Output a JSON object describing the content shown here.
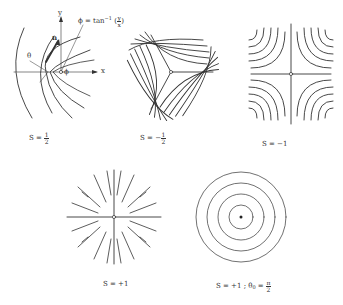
{
  "figure": {
    "panels": [
      {
        "id": "s-half",
        "caption": {
          "prefix": "S = ",
          "sign": "",
          "num": "1",
          "den": "2"
        },
        "annotations": {
          "y_axis": "y",
          "x_axis": "x",
          "phi": "ϕ",
          "theta": "θ",
          "n_vector": "n",
          "phi_formula": {
            "lhs": "ϕ = tan",
            "sup": "−1",
            "open": "(",
            "num": "y",
            "den": "x",
            "close": ")"
          }
        }
      },
      {
        "id": "s-minus-half",
        "caption": {
          "prefix": "S = ",
          "sign": "−",
          "num": "1",
          "den": "2"
        }
      },
      {
        "id": "s-minus-one",
        "caption": {
          "text": "S = −1"
        }
      },
      {
        "id": "s-plus-one-radial",
        "caption": {
          "text": "S = +1"
        }
      },
      {
        "id": "s-plus-one-circular",
        "caption": {
          "prefix": "S = +1 ; θ",
          "sub": "0",
          "eq": " = ",
          "num": "π",
          "den": "2"
        }
      }
    ]
  },
  "colors": {
    "line": "#333333",
    "background": "#ffffff"
  }
}
